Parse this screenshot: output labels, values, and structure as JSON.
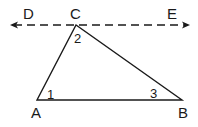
{
  "diagram": {
    "type": "geometry",
    "points": {
      "A": {
        "label": "A",
        "x": 37,
        "y": 100
      },
      "B": {
        "label": "B",
        "x": 182,
        "y": 100
      },
      "C": {
        "label": "C",
        "x": 76,
        "y": 25
      },
      "D": {
        "label": "D"
      },
      "E": {
        "label": "E"
      }
    },
    "angles": {
      "angle1": {
        "label": "1",
        "vertex": "A"
      },
      "angle2": {
        "label": "2",
        "vertex": "C"
      },
      "angle3": {
        "label": "3",
        "vertex": "B"
      }
    },
    "line_DE": {
      "style": "dashed",
      "arrows": "both"
    },
    "colors": {
      "stroke": "#1a1a1a",
      "background": "#ffffff"
    }
  }
}
